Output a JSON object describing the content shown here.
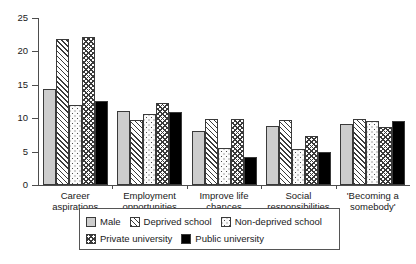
{
  "chart_data": {
    "type": "bar",
    "title": "",
    "subtitle": "",
    "xlabel": "",
    "ylabel": "",
    "ylim": [
      0,
      25
    ],
    "yticks": [
      0,
      5,
      10,
      15,
      20,
      25
    ],
    "grid": false,
    "legend_position": "bottom",
    "categories": [
      "Career aspirations",
      "Employment opportunities",
      "Improve life chances",
      "Social responsibilities",
      "'Becoming a somebody'"
    ],
    "category_lines": [
      [
        "Career",
        "aspirations"
      ],
      [
        "Employment",
        "opportunities"
      ],
      [
        "Improve life",
        "chances"
      ],
      [
        "Social",
        "responsibilities"
      ],
      [
        "'Becoming a",
        "somebody'"
      ]
    ],
    "series": [
      {
        "name": "Male",
        "pattern": "solid-light-grey",
        "color": "#cdcdcd",
        "values": [
          14.3,
          11.1,
          8.1,
          8.9,
          9.2
        ]
      },
      {
        "name": "Deprived school",
        "pattern": "diagonal-hatch",
        "color": "#ffffff",
        "values": [
          21.8,
          9.8,
          9.9,
          9.7,
          9.9
        ]
      },
      {
        "name": "Non-deprived school",
        "pattern": "dotted",
        "color": "#fbfbfb",
        "values": [
          12.0,
          10.6,
          5.6,
          5.4,
          9.6
        ]
      },
      {
        "name": "Private university",
        "pattern": "cross-hatch",
        "color": "#ffffff",
        "values": [
          22.2,
          12.3,
          9.9,
          7.3,
          8.7
        ]
      },
      {
        "name": "Public university",
        "pattern": "solid-black",
        "color": "#000000",
        "values": [
          12.6,
          11.0,
          4.2,
          5.0,
          9.6
        ]
      }
    ]
  },
  "legend": {
    "row1": [
      "Male",
      "Deprived school",
      "Non-deprived school"
    ],
    "row2": [
      "Private university",
      "Public university"
    ]
  },
  "axis": {
    "y_tick_labels": [
      "25",
      "20",
      "15",
      "10",
      "5",
      "0"
    ]
  }
}
